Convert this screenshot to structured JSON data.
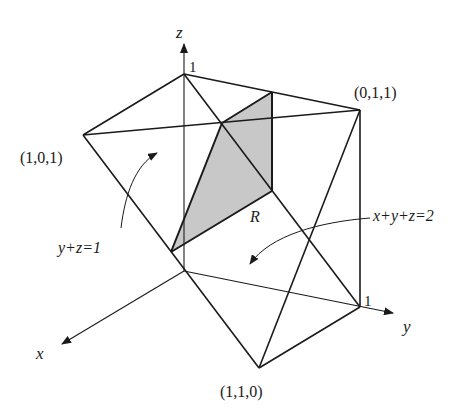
{
  "figure": {
    "colors": {
      "line": "#1a1a1a",
      "shade": "#c8c8c8",
      "background": "#ffffff"
    },
    "axes": {
      "x_label": "x",
      "y_label": "y",
      "z_label": "z",
      "z_tick": "1",
      "y_tick": "1"
    },
    "vertices": {
      "p101": "(1,0,1)",
      "p011": "(0,1,1)",
      "p110": "(1,1,0)"
    },
    "region_label": "R",
    "plane_labels": {
      "plane1": "y+z=1",
      "plane2": "x+y+z=2"
    }
  }
}
